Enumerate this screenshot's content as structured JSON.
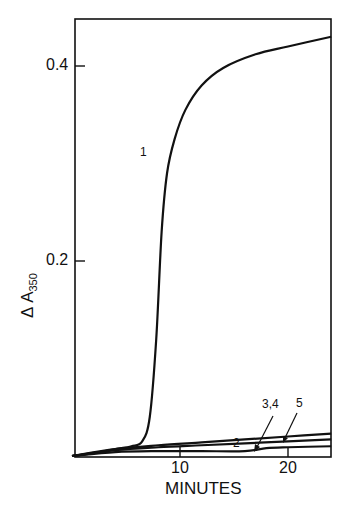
{
  "chart_data": {
    "type": "line",
    "title": "",
    "xlabel": "MINUTES",
    "ylabel": "Δ A350",
    "ylabel_main": "Δ A",
    "ylabel_sub": "350",
    "xlim": [
      0,
      24
    ],
    "ylim": [
      0,
      0.45
    ],
    "x_ticks": [
      10,
      20
    ],
    "x_tick_labels": [
      "10",
      "20"
    ],
    "y_ticks": [
      0.2,
      0.4
    ],
    "y_tick_labels": [
      "0.2",
      "0.4"
    ],
    "grid": false,
    "legend": "inline curve labels",
    "series": [
      {
        "name": "1",
        "x": [
          0,
          2,
          4,
          5.5,
          6.5,
          7.2,
          7.8,
          8.3,
          8.8,
          9.5,
          10.5,
          12,
          14,
          17,
          20,
          24
        ],
        "y": [
          0,
          0.003,
          0.007,
          0.01,
          0.015,
          0.04,
          0.12,
          0.23,
          0.29,
          0.325,
          0.355,
          0.38,
          0.398,
          0.412,
          0.42,
          0.43
        ]
      },
      {
        "name": "2",
        "x": [
          0,
          4,
          8,
          12,
          16,
          20,
          24
        ],
        "y": [
          0,
          0.007,
          0.011,
          0.014,
          0.017,
          0.02,
          0.023
        ]
      },
      {
        "name": "3,4",
        "x": [
          0,
          4,
          8,
          12,
          16,
          20,
          24
        ],
        "y": [
          0,
          0.006,
          0.009,
          0.011,
          0.013,
          0.015,
          0.017
        ]
      },
      {
        "name": "5",
        "x": [
          0,
          4,
          8,
          12,
          16,
          18,
          20,
          24
        ],
        "y": [
          0,
          0.004,
          0.005,
          0.005,
          0.005,
          0.008,
          0.009,
          0.01
        ]
      }
    ],
    "annotations": [
      {
        "text": "1",
        "x": 8.6,
        "y": 0.31
      },
      {
        "text": "2",
        "x": 15.5,
        "y": 0.025
      },
      {
        "text": "3,4",
        "x": 17.5,
        "y": 0.043
      },
      {
        "text": "5",
        "x": 20.5,
        "y": 0.046
      }
    ]
  }
}
